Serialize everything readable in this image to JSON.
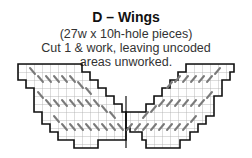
{
  "title": "D – Wings",
  "subtitle_lines": [
    "(27w x 10h-hole pieces)",
    "Cut 1 & work, leaving uncoded",
    "areas unworked."
  ],
  "colors": {
    "outline": "#111111",
    "grid": "#aaaaaa",
    "stitch": "#7a7a7a"
  }
}
